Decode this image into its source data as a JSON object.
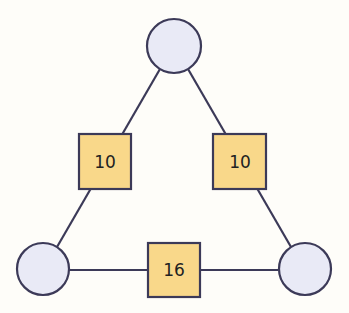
{
  "diagram": {
    "type": "triangle-graph",
    "colors": {
      "background": "#fefdf9",
      "node_fill": "#e9eaf6",
      "box_fill": "#f9d88a",
      "stroke": "#3c3a58"
    },
    "nodes": [
      {
        "id": "top",
        "label": ""
      },
      {
        "id": "bottom-left",
        "label": ""
      },
      {
        "id": "bottom-right",
        "label": ""
      }
    ],
    "edges": [
      {
        "from": "top",
        "to": "bottom-left",
        "label": "10"
      },
      {
        "from": "top",
        "to": "bottom-right",
        "label": "10"
      },
      {
        "from": "bottom-left",
        "to": "bottom-right",
        "label": "16"
      }
    ]
  }
}
